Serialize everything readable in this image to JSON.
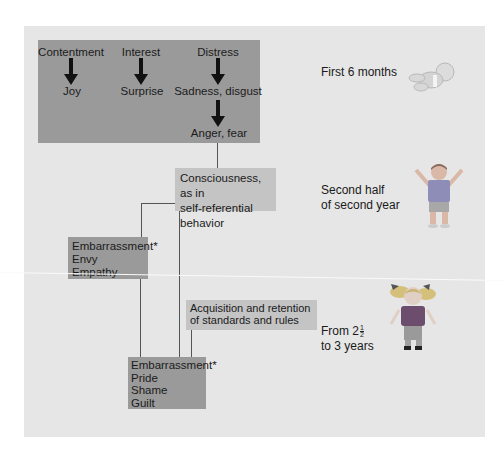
{
  "diagram": {
    "primary_emotions": {
      "sources": [
        "Contentment",
        "Interest",
        "Distress"
      ],
      "results": [
        "Joy",
        "Surprise",
        "Sadness, disgust"
      ],
      "secondary_result": "Anger, fear"
    },
    "consciousness_box": [
      "Consciousness, as in",
      "self-referential",
      "behavior"
    ],
    "exposed_emotions_box": [
      "Embarrassment*",
      "Envy",
      "Empathy"
    ],
    "standards_box": [
      "Acquisition and retention",
      "of standards and rules"
    ],
    "evaluative_emotions_box": [
      "Embarrassment*",
      "Pride",
      "Shame",
      "Guilt"
    ],
    "stages": [
      {
        "label": [
          "First 6 months"
        ],
        "figure": "infant-icon"
      },
      {
        "label": [
          "Second half",
          "of second year"
        ],
        "figure": "toddler-boy-icon"
      },
      {
        "label_prefix": "From 2",
        "fraction": {
          "num": "1",
          "den": "2"
        },
        "label_line2": "to 3 years",
        "figure": "toddler-girl-icon"
      }
    ]
  },
  "colors": {
    "panel": "#e6e6e6",
    "dark_box": "#9a9a9a",
    "light_box": "#c4c4c4",
    "line": "#555555"
  }
}
